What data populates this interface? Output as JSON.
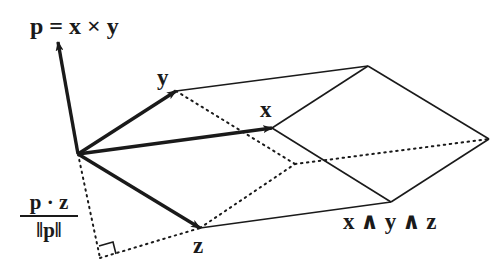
{
  "diagram": {
    "colors": {
      "ink": "#1a1a1a",
      "background": "#ffffff"
    },
    "labels": {
      "p": "p = x × y",
      "y": "y",
      "x": "x",
      "z": "z",
      "wedge": "x ∧ y ∧ z",
      "frac_num": "p · z",
      "frac_den": "‖p‖"
    },
    "vectors": [
      {
        "name": "p",
        "from": [
          78,
          154
        ],
        "to": [
          58,
          42
        ]
      },
      {
        "name": "y",
        "from": [
          78,
          154
        ],
        "to": [
          176,
          91
        ]
      },
      {
        "name": "x",
        "from": [
          78,
          154
        ],
        "to": [
          272,
          128
        ]
      },
      {
        "name": "z",
        "from": [
          78,
          154
        ],
        "to": [
          200,
          228
        ]
      }
    ],
    "solid_edges": [
      [
        [
          176,
          91
        ],
        [
          368,
          66
        ]
      ],
      [
        [
          272,
          128
        ],
        [
          368,
          66
        ]
      ],
      [
        [
          368,
          66
        ],
        [
          489,
          139
        ]
      ],
      [
        [
          272,
          128
        ],
        [
          391,
          202
        ]
      ],
      [
        [
          489,
          139
        ],
        [
          391,
          202
        ]
      ],
      [
        [
          200,
          228
        ],
        [
          391,
          202
        ]
      ]
    ],
    "dotted_edges": [
      [
        [
          176,
          91
        ],
        [
          295,
          164
        ]
      ],
      [
        [
          200,
          228
        ],
        [
          295,
          164
        ]
      ],
      [
        [
          295,
          164
        ],
        [
          489,
          139
        ]
      ],
      [
        [
          78,
          154
        ],
        [
          100,
          258
        ]
      ],
      [
        [
          100,
          258
        ],
        [
          200,
          228
        ]
      ]
    ],
    "right_angle": [
      [
        99,
        246
      ],
      [
        113,
        242
      ],
      [
        116,
        254
      ]
    ]
  }
}
